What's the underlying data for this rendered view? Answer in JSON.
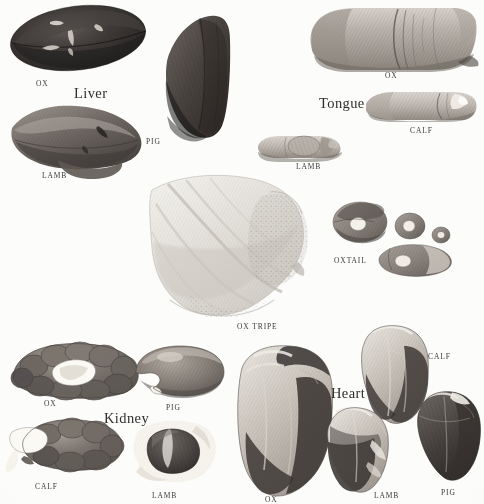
{
  "plate": {
    "kind": "scanned-illustration-plate",
    "subject": "offal-cuts",
    "background_color": "#fcfcfb",
    "ink_color": "#3b3a38",
    "width": 484,
    "height": 500
  },
  "headings": [
    {
      "id": "liver",
      "label": "Liver",
      "x": 74,
      "y": 86
    },
    {
      "id": "tongue",
      "label": "Tongue",
      "x": 319,
      "y": 96
    },
    {
      "id": "kidney",
      "label": "Kidney",
      "x": 104,
      "y": 411
    },
    {
      "id": "heart",
      "label": "Heart",
      "x": 331,
      "y": 386
    }
  ],
  "groups": [
    {
      "id": "liver",
      "heading": "Liver",
      "specimens": [
        {
          "id": "liver-ox",
          "label": "OX",
          "x": 36,
          "y": 80,
          "tone": "dark"
        },
        {
          "id": "liver-pig",
          "label": "PIG",
          "x": 146,
          "y": 138,
          "tone": "dark"
        },
        {
          "id": "liver-lamb",
          "label": "LAMB",
          "x": 42,
          "y": 172,
          "tone": "medium"
        }
      ]
    },
    {
      "id": "tongue",
      "heading": "Tongue",
      "specimens": [
        {
          "id": "tongue-ox",
          "label": "OX",
          "x": 385,
          "y": 72,
          "tone": "light"
        },
        {
          "id": "tongue-calf",
          "label": "CALF",
          "x": 410,
          "y": 127,
          "tone": "light"
        },
        {
          "id": "tongue-lamb",
          "label": "LAMB",
          "x": 296,
          "y": 163,
          "tone": "light"
        }
      ]
    },
    {
      "id": "tripe",
      "heading": "",
      "specimens": [
        {
          "id": "ox-tripe",
          "label": "OX TRIPE",
          "x": 237,
          "y": 323,
          "tone": "very-light"
        }
      ]
    },
    {
      "id": "oxtail",
      "heading": "",
      "specimens": [
        {
          "id": "oxtail",
          "label": "OXTAIL",
          "x": 334,
          "y": 257,
          "tone": "light"
        }
      ]
    },
    {
      "id": "kidney",
      "heading": "Kidney",
      "specimens": [
        {
          "id": "kidney-ox",
          "label": "OX",
          "x": 44,
          "y": 400,
          "tone": "medium"
        },
        {
          "id": "kidney-pig",
          "label": "PIG",
          "x": 166,
          "y": 404,
          "tone": "medium"
        },
        {
          "id": "kidney-calf",
          "label": "CALF",
          "x": 35,
          "y": 483,
          "tone": "medium"
        },
        {
          "id": "kidney-lamb",
          "label": "LAMB",
          "x": 152,
          "y": 492,
          "tone": "dark"
        }
      ]
    },
    {
      "id": "heart",
      "heading": "Heart",
      "specimens": [
        {
          "id": "heart-calf",
          "label": "CALF",
          "x": 428,
          "y": 353,
          "tone": "mixed"
        },
        {
          "id": "heart-ox",
          "label": "OX",
          "x": 265,
          "y": 496,
          "tone": "mixed"
        },
        {
          "id": "heart-lamb",
          "label": "LAMB",
          "x": 374,
          "y": 492,
          "tone": "mixed"
        },
        {
          "id": "heart-pig",
          "label": "PIG",
          "x": 441,
          "y": 489,
          "tone": "mixed"
        }
      ]
    }
  ]
}
